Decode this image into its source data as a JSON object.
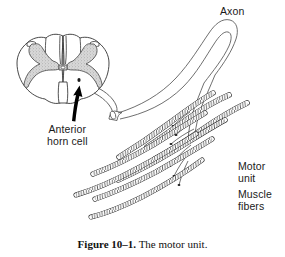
{
  "figure": {
    "caption_number": "Figure 10–1.",
    "caption_text": "The motor unit.",
    "background_color": "#ffffff",
    "ink_color": "#1a1a1a",
    "gray_matter_fill": "#cccccc"
  },
  "labels": {
    "axon": "Axon",
    "anterior_horn_cell_line1": "Anterior",
    "anterior_horn_cell_line2": "horn cell",
    "motor_unit_line1": "Motor",
    "motor_unit_line2": "unit",
    "muscle_fibers_line1": "Muscle",
    "muscle_fibers_line2": "fibers"
  },
  "diagram": {
    "spinal_cord_cross_section": "spinal-cord-cross-section",
    "gray_matter": "butterfly-shaped-gray-matter",
    "anterior_horn_arrow": "black-arrow-pointing-to-anterior-horn",
    "nerve_root": "ventral-nerve-root-stump",
    "axon_path": "long-looping-motor-axon",
    "muscle_fiber_count": 8,
    "terminal_branch_count": 8
  }
}
